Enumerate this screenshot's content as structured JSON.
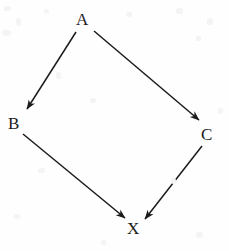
{
  "figure": {
    "type": "directed-graph",
    "background_color": "#fefefe",
    "ink_color": "#1b1b1b"
  },
  "nodes": [
    {
      "id": "A",
      "label": "A",
      "x": 83,
      "y": 19
    },
    {
      "id": "B",
      "label": "B",
      "x": 15,
      "y": 123
    },
    {
      "id": "C",
      "label": "C",
      "x": 208,
      "y": 134
    },
    {
      "id": "X",
      "label": "X",
      "x": 133,
      "y": 228
    }
  ],
  "edges": [
    {
      "id": "a-to-b",
      "from": "A",
      "to": "B",
      "label": "",
      "x1": 76,
      "y1": 32,
      "x2": 27,
      "y2": 109
    },
    {
      "id": "a-to-c",
      "from": "A",
      "to": "C",
      "label": "",
      "x1": 94,
      "y1": 31,
      "x2": 199,
      "y2": 120
    },
    {
      "id": "b-to-x",
      "from": "B",
      "to": "X",
      "label": "",
      "x1": 23,
      "y1": 134,
      "x2": 125,
      "y2": 218
    },
    {
      "id": "c-to-x",
      "from": "C",
      "to": "X",
      "label": "",
      "x1": 202,
      "y1": 146,
      "x2": 145,
      "y2": 219
    }
  ],
  "specks": [
    {
      "x": 4,
      "y": 6,
      "w": 7,
      "h": 5
    },
    {
      "x": 16,
      "y": 18,
      "w": 5,
      "h": 8
    },
    {
      "x": 2,
      "y": 30,
      "w": 9,
      "h": 6
    },
    {
      "x": 44,
      "y": 9,
      "w": 5,
      "h": 4
    },
    {
      "x": 126,
      "y": 12,
      "w": 6,
      "h": 5
    },
    {
      "x": 176,
      "y": 8,
      "w": 7,
      "h": 6
    },
    {
      "x": 207,
      "y": 18,
      "w": 6,
      "h": 7
    },
    {
      "x": 196,
      "y": 36,
      "w": 5,
      "h": 5
    },
    {
      "x": 56,
      "y": 72,
      "w": 5,
      "h": 7
    },
    {
      "x": 90,
      "y": 98,
      "w": 6,
      "h": 5
    },
    {
      "x": 38,
      "y": 168,
      "w": 7,
      "h": 5
    },
    {
      "x": 171,
      "y": 178,
      "w": 5,
      "h": 6
    },
    {
      "x": 14,
      "y": 214,
      "w": 6,
      "h": 5
    },
    {
      "x": 196,
      "y": 232,
      "w": 7,
      "h": 6
    },
    {
      "x": 101,
      "y": 240,
      "w": 5,
      "h": 5
    },
    {
      "x": 218,
      "y": 108,
      "w": 5,
      "h": 6
    }
  ]
}
